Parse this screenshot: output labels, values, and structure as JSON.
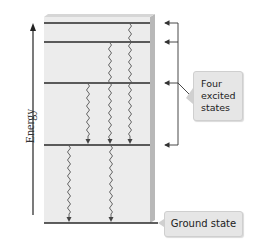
{
  "diagram": {
    "axis_label": "Energy",
    "callouts": {
      "excited": "Four\nexcited\nstates",
      "excited_lines": [
        "Four",
        "excited",
        "states"
      ],
      "ground": "Ground state"
    },
    "levels": [
      {
        "name": "excited-4",
        "y": 23
      },
      {
        "name": "excited-3",
        "y": 42
      },
      {
        "name": "excited-2",
        "y": 83
      },
      {
        "name": "excited-1",
        "y": 145
      },
      {
        "name": "ground",
        "y": 223
      }
    ],
    "transitions": [
      {
        "x": 130,
        "from": 23,
        "to": 145
      },
      {
        "x": 110,
        "from": 42,
        "to": 145
      },
      {
        "x": 88,
        "from": 83,
        "to": 145
      },
      {
        "x": 69,
        "from": 145,
        "to": 223
      },
      {
        "x": 111,
        "from": 145,
        "to": 223
      }
    ],
    "colors": {
      "panel": "#ececec",
      "panel_edge": "#b8b8b8",
      "line": "#2a2a2a",
      "callout_bg": "#e6e6e6"
    }
  }
}
